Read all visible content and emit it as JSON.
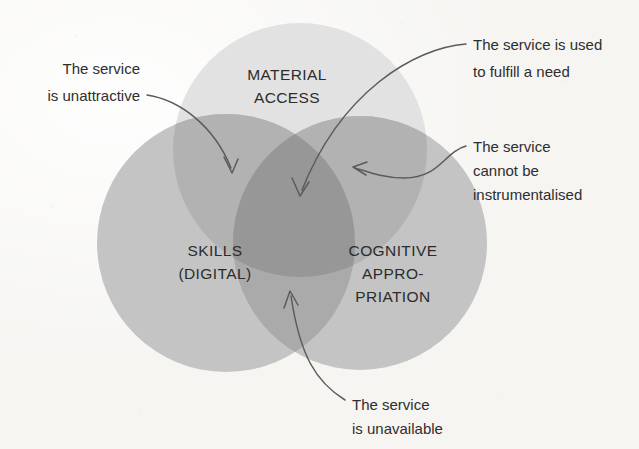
{
  "diagram": {
    "background_color": "#f6f5f2",
    "sets": [
      {
        "id": "material-access",
        "label_line1": "MATERIAL",
        "label_line2": "ACCESS",
        "color": "#e2e2e2",
        "cx": 300,
        "cy": 150,
        "r": 127
      },
      {
        "id": "skills-digital",
        "label_line1": "SKILLS",
        "label_line2": "(DIGITAL)",
        "color": "#c4c4c4",
        "cx": 226,
        "cy": 243,
        "r": 129
      },
      {
        "id": "cognitive-appropriation",
        "label_line1": "COGNITIVE",
        "label_line2": "APPRO-",
        "label_line3": "PRIATION",
        "color": "#c4c4c4",
        "cx": 360,
        "cy": 243,
        "r": 127
      }
    ],
    "overlap_colors": {
      "two_set": "#aaaaaa",
      "three_set": "#979797"
    },
    "callouts": [
      {
        "id": "unattractive",
        "side": "left",
        "lines": [
          "The service",
          "is unattractive"
        ],
        "target": "material-access and skills overlap"
      },
      {
        "id": "fulfill-need",
        "side": "right",
        "lines": [
          "The service is used",
          "to fulfill a need"
        ],
        "target": "centre triple overlap"
      },
      {
        "id": "not-instrumentalised",
        "side": "right",
        "lines": [
          "The service",
          "cannot be",
          "instrumentalised"
        ],
        "target": "cognitive appropriation circle"
      },
      {
        "id": "unavailable",
        "side": "right",
        "lines": [
          "The service",
          "is unavailable"
        ],
        "target": "skills and cognitive overlap"
      }
    ]
  }
}
